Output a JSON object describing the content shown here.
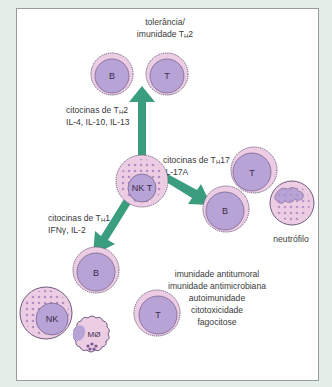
{
  "diagram": {
    "colors": {
      "background": "#e4eee9",
      "panel": "#ffffff",
      "arrow": "#3a9d7e",
      "cell_outer": "#eccde3",
      "cell_nucleus": "#b7a3d6",
      "cell_outline": "#6e5a7e",
      "granule": "#b28ec4"
    },
    "top_group": {
      "label_line1": "tolerância/",
      "label_line2_main": "imunidade T",
      "label_line2_sub": "H",
      "label_line2_end": "2",
      "cells": [
        "B",
        "T"
      ]
    },
    "th2_arrow": {
      "line1_main": "citocinas de T",
      "line1_sub": "H",
      "line1_end": "2",
      "line2": "IL-4, IL-10, IL-13"
    },
    "center_cell": "NK T",
    "th17_arrow": {
      "line1_main": "citocinas de T",
      "line1_sub": "H",
      "line1_end": "17",
      "line2": "IL-17A"
    },
    "right_group": {
      "cells": [
        "T",
        "B"
      ],
      "neutrophil_label": "neutrófilo"
    },
    "th1_arrow": {
      "line1_main": "citocinas de T",
      "line1_sub": "H",
      "line1_end": "1",
      "line2": "IFNγ, IL-2"
    },
    "bottom_group": {
      "cells": [
        "B",
        "NK",
        "T",
        "MØ"
      ],
      "effects": [
        "imunidade antitumoral",
        "imunidade antimicrobiana",
        "autoimunidade",
        "citotoxicidade",
        "fagocitose"
      ]
    }
  }
}
